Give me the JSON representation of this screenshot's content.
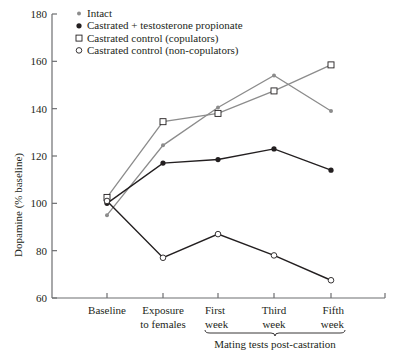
{
  "chart_data": {
    "type": "line",
    "title": "",
    "xlabel": "Mating tests post-castration",
    "ylabel": "Dopamine (% baseline)",
    "ylim": [
      60,
      180
    ],
    "yticks": [
      60,
      80,
      100,
      120,
      140,
      160,
      180
    ],
    "categories": [
      "Baseline",
      "Exposure to females",
      "First week",
      "Third week",
      "Fifth week"
    ],
    "category_lines": [
      [
        "Baseline"
      ],
      [
        "Exposure",
        "to females"
      ],
      [
        "First",
        "week"
      ],
      [
        "Third",
        "week"
      ],
      [
        "Fifth",
        "week"
      ]
    ],
    "bracket_label": "Mating tests post-castration",
    "bracket_span": [
      "First week",
      "Fifth week"
    ],
    "grid": false,
    "legend_position": "top-left",
    "series": [
      {
        "name": "Intact",
        "marker": "small-gray-dot",
        "color": "#8c8c8c",
        "values": [
          95,
          124.5,
          140.5,
          154,
          139
        ]
      },
      {
        "name": "Castrated + testosterone propionate",
        "marker": "filled-circle",
        "color": "#231f20",
        "values": [
          100,
          117,
          118.5,
          123,
          114
        ]
      },
      {
        "name": "Castrated control (copulators)",
        "marker": "open-square",
        "color": "#8c8c8c",
        "values": [
          102.5,
          134.5,
          138,
          147.5,
          158.5
        ]
      },
      {
        "name": "Castrated control (non-copulators)",
        "marker": "open-circle",
        "color": "#231f20",
        "values": [
          101,
          77,
          87,
          78,
          67.5
        ]
      }
    ]
  }
}
